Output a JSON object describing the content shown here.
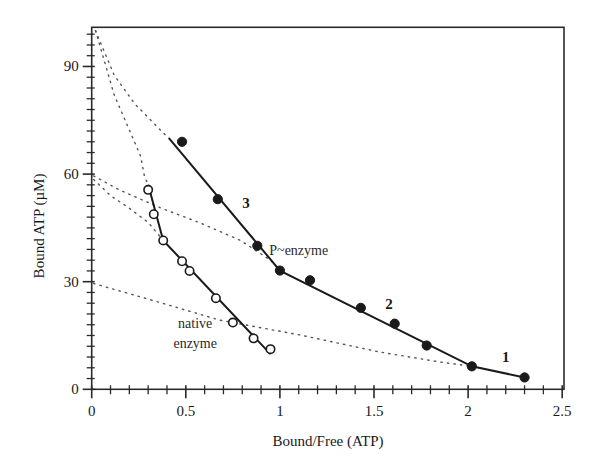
{
  "chart_data": {
    "type": "scatter",
    "title": "",
    "xlabel": "Bound/Free (ATP)",
    "ylabel": "Bound ATP (µM)",
    "xlim": [
      0,
      2.5
    ],
    "ylim": [
      0,
      101
    ],
    "grid": false,
    "legend": "none",
    "x_ticks": [
      {
        "value": 0,
        "label": "0"
      },
      {
        "value": 0.5,
        "label": "0.5"
      },
      {
        "value": 1,
        "label": "1"
      },
      {
        "value": 1.5,
        "label": "1.5"
      },
      {
        "value": 2,
        "label": "2"
      },
      {
        "value": 2.5,
        "label": "2.5"
      }
    ],
    "x_minor_step": 0.1,
    "y_ticks": [
      {
        "value": 0,
        "label": "0"
      },
      {
        "value": 30,
        "label": "30"
      },
      {
        "value": 60,
        "label": "60"
      },
      {
        "value": 90,
        "label": "90"
      }
    ],
    "y_minor_step": 3,
    "series": [
      {
        "name": "P~enzyme",
        "marker": "filled-circle",
        "points": [
          {
            "x": 0.48,
            "y": 69.0
          },
          {
            "x": 0.67,
            "y": 53.0
          },
          {
            "x": 0.88,
            "y": 40.0
          },
          {
            "x": 1.0,
            "y": 33.1
          },
          {
            "x": 1.16,
            "y": 30.4
          },
          {
            "x": 1.43,
            "y": 22.7
          },
          {
            "x": 1.61,
            "y": 18.3
          },
          {
            "x": 1.78,
            "y": 12.2
          },
          {
            "x": 2.02,
            "y": 6.4
          },
          {
            "x": 2.3,
            "y": 3.3
          }
        ],
        "fit_line": [
          {
            "x": 0.41,
            "y": 70.0
          },
          {
            "x": 1.0,
            "y": 33.1
          },
          {
            "x": 2.02,
            "y": 6.4
          },
          {
            "x": 2.3,
            "y": 3.3
          }
        ]
      },
      {
        "name": "native enzyme",
        "marker": "open-circle",
        "points": [
          {
            "x": 0.3,
            "y": 55.6
          },
          {
            "x": 0.33,
            "y": 48.8
          },
          {
            "x": 0.38,
            "y": 41.5
          },
          {
            "x": 0.48,
            "y": 35.7
          },
          {
            "x": 0.52,
            "y": 33.0
          },
          {
            "x": 0.66,
            "y": 25.4
          },
          {
            "x": 0.75,
            "y": 18.6
          },
          {
            "x": 0.86,
            "y": 14.2
          },
          {
            "x": 0.95,
            "y": 11.2
          }
        ],
        "fit_line": [
          {
            "x": 0.3,
            "y": 57.0
          },
          {
            "x": 0.38,
            "y": 41.5
          },
          {
            "x": 0.95,
            "y": 9.8
          }
        ]
      }
    ],
    "dotted_curves": [
      {
        "name": "extrapolation-3",
        "points": [
          [
            0.02,
            100
          ],
          [
            0.06,
            95
          ],
          [
            0.12,
            87.5
          ],
          [
            0.23,
            79.5
          ],
          [
            0.38,
            71.5
          ],
          [
            0.41,
            70.0
          ]
        ]
      },
      {
        "name": "extrapolation-native-upper",
        "points": [
          [
            0.02,
            100
          ],
          [
            0.07,
            91
          ],
          [
            0.12,
            82
          ],
          [
            0.19,
            73.5
          ],
          [
            0.26,
            65
          ],
          [
            0.28,
            59.5
          ],
          [
            0.3,
            57.0
          ]
        ]
      },
      {
        "name": "extrapolation-2",
        "points": [
          [
            0.01,
            59.5
          ],
          [
            0.15,
            55.5
          ],
          [
            0.37,
            50.5
          ],
          [
            0.58,
            46.3
          ],
          [
            0.79,
            41.5
          ],
          [
            0.95,
            36.0
          ],
          [
            1.0,
            33.1
          ]
        ]
      },
      {
        "name": "extrapolation-native-lower",
        "points": [
          [
            0.01,
            58.5
          ],
          [
            0.1,
            54
          ],
          [
            0.2,
            50.5
          ],
          [
            0.3,
            46.5
          ],
          [
            0.38,
            41.5
          ]
        ]
      },
      {
        "name": "extrapolation-1",
        "points": [
          [
            0.01,
            29.5
          ],
          [
            0.31,
            25.0
          ],
          [
            0.68,
            19.3
          ],
          [
            1.11,
            15.1
          ],
          [
            1.53,
            10.4
          ],
          [
            1.85,
            7.6
          ],
          [
            2.02,
            6.4
          ]
        ]
      }
    ],
    "annotations": [
      {
        "id": "label-3",
        "text": "3",
        "x": 0.8,
        "y": 50.5,
        "bold": true
      },
      {
        "id": "label-2",
        "text": "2",
        "x": 1.56,
        "y": 22.3,
        "bold": true
      },
      {
        "id": "label-1",
        "text": "1",
        "x": 2.18,
        "y": 7.6,
        "bold": true
      },
      {
        "id": "label-p-enzyme",
        "text": "P~enzyme",
        "x": 1.1,
        "y": 37.5,
        "bold": false
      },
      {
        "id": "label-native-line1",
        "text": "native",
        "x": 0.55,
        "y": 17.0,
        "bold": false
      },
      {
        "id": "label-native-line2",
        "text": "enzyme",
        "x": 0.55,
        "y": 11.6,
        "bold": false
      }
    ]
  }
}
